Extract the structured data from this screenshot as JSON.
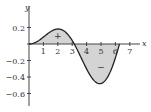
{
  "chart_data": {
    "type": "area",
    "title": "",
    "xlabel": "x",
    "ylabel": "y",
    "function_hint": "y = x·sin(x)/10",
    "xlim": [
      0,
      7.3
    ],
    "ylim": [
      -0.7,
      0.28
    ],
    "x_ticks": [
      1,
      2,
      3,
      4,
      5,
      6,
      7
    ],
    "x_tick_labels": [
      "1",
      "2",
      "3",
      "4",
      "5",
      "6",
      "7"
    ],
    "y_ticks": [
      0.2,
      -0.2,
      -0.4,
      -0.6
    ],
    "y_tick_labels": [
      "0.2",
      "−0.2",
      "−0.4",
      "−0.6"
    ],
    "x": [
      0,
      0.5,
      1,
      1.5,
      2,
      2.5,
      3,
      3.14,
      3.5,
      4,
      4.5,
      5,
      5.5,
      6,
      6.28
    ],
    "values": [
      0,
      0.024,
      0.084,
      0.15,
      0.182,
      0.15,
      0.042,
      0,
      -0.123,
      -0.303,
      -0.44,
      -0.479,
      -0.389,
      -0.168,
      0
    ],
    "annotations": [
      {
        "text": "+",
        "x": 2,
        "y": 0.1
      },
      {
        "text": "−",
        "x": 5,
        "y": -0.28
      }
    ],
    "shaded": true,
    "grid": false,
    "colors": {
      "fill": "#d4d4d4",
      "curve": "#222222",
      "axis": "#444444"
    }
  },
  "axes": {
    "x_label": "x",
    "y_label": "y"
  },
  "labels": {
    "plus": "+",
    "minus": "−"
  }
}
